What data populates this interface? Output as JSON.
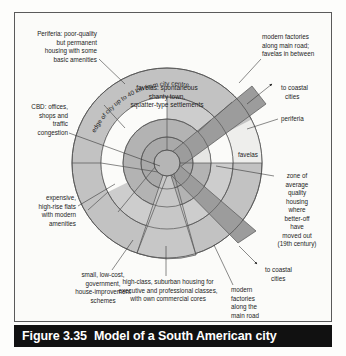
{
  "figure": {
    "number": "Figure 3.35",
    "title": "Model of a South American city"
  },
  "diagram": {
    "type": "concentric-zone-model",
    "center": {
      "x": 167,
      "y": 163
    },
    "outer_radius": 95,
    "ring_radii": [
      13,
      26,
      44,
      66,
      95
    ],
    "colors": {
      "cbd": "#a8a8a8",
      "inner_ring": "#b0b0b0",
      "light_ring": "#fbfbf9",
      "mid_ring": "#c9c9c9",
      "outer_ring": "#c2c2c2",
      "spine": "#9a9a9a",
      "spine_dark": "#8f8f8f",
      "outline": "#555555",
      "caption_bar": "#111111",
      "caption_text": "#ffffff",
      "panel_border": "#5a5a5a",
      "label_text": "#1c1c1c"
    }
  },
  "labels": {
    "periferia_top_left": [
      "Periferia: poor-quality",
      "but permanent",
      "housing with some",
      "basic amenities"
    ],
    "edge_of_city": "edge of city up to 40 km from city centre",
    "favelas_inner": [
      "favelas: spontaneous",
      "shanty town,",
      "squatter-type settlements"
    ],
    "modern_factories_top": [
      "modern factories",
      "along main road;",
      "favelas in between"
    ],
    "to_coastal_cities_top": [
      "to coastal",
      "cities"
    ],
    "periferia_right": "periferia",
    "favelas_right": "favelas",
    "zone_of_average": [
      "zone of",
      "average",
      "quality",
      "housing",
      "where",
      "better-off",
      "have",
      "moved out",
      "(19th century)"
    ],
    "cbd_left": [
      "CBD: offices,",
      "shops and",
      "traffic",
      "congestion"
    ],
    "expensive_flats": [
      "expensive,",
      "high-rise flats",
      "with modern",
      "amenities"
    ],
    "small_low_cost": [
      "small, low-cost,",
      "government,",
      "house-improvement",
      "schemes"
    ],
    "high_class_suburban": [
      "high-class, suburban housing for",
      "executive and professional classes,",
      "with own commercial cores"
    ],
    "to_coastal_cities_bottom": [
      "to coastal",
      "cities"
    ],
    "modern_factories_bottom": [
      "modern",
      "factories",
      "along the",
      "main road"
    ]
  }
}
